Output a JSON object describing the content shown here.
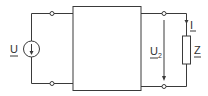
{
  "diagram": {
    "type": "two-port circuit",
    "source": {
      "label": "U",
      "kind": "voltage-source",
      "arrow": "down"
    },
    "output_voltage": {
      "label": "U",
      "subscript": "2"
    },
    "current": {
      "label": "I"
    },
    "load": {
      "label": "Z",
      "kind": "impedance"
    },
    "block": {
      "label": ""
    },
    "colors": {
      "line": "#3a3a3a",
      "background": "#ffffff"
    }
  }
}
